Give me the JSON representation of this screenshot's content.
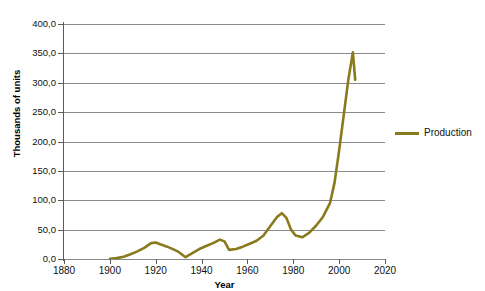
{
  "chart_data": {
    "type": "line",
    "title": "",
    "xlabel": "Year",
    "ylabel": "Thousands of units",
    "xlim": [
      1880,
      2020
    ],
    "ylim": [
      0,
      400
    ],
    "grid": "horizontal",
    "legend_position": "right",
    "line_color": "#8a7a1e",
    "x_ticks": [
      "1880",
      "1900",
      "1920",
      "1940",
      "1960",
      "1980",
      "2000",
      "2020"
    ],
    "y_ticks": [
      "0,0",
      "50,0",
      "100,0",
      "150,0",
      "200,0",
      "250,0",
      "300,0",
      "350,0",
      "400,0"
    ],
    "series": [
      {
        "name": "Production",
        "color": "#8a7a1e",
        "x": [
          1900,
          1903,
          1906,
          1909,
          1912,
          1915,
          1918,
          1920,
          1922,
          1925,
          1928,
          1930,
          1933,
          1936,
          1939,
          1942,
          1945,
          1948,
          1950,
          1952,
          1955,
          1958,
          1961,
          1964,
          1967,
          1970,
          1973,
          1975,
          1977,
          1979,
          1981,
          1984,
          1987,
          1990,
          1993,
          1996,
          1998,
          2000,
          2002,
          2004,
          2006,
          2007
        ],
        "values": [
          0.5,
          1.5,
          4.0,
          8.0,
          13.0,
          19.0,
          27.0,
          28.0,
          25.0,
          21.0,
          16.0,
          12.0,
          3.0,
          10.0,
          17.0,
          22.0,
          27.0,
          33.0,
          30.0,
          15.5,
          17.0,
          21.0,
          26.0,
          31.0,
          40.0,
          56.0,
          72.0,
          78.0,
          70.0,
          50.0,
          40.0,
          37.0,
          45.0,
          57.0,
          72.0,
          95.0,
          130.0,
          185.0,
          245.0,
          305.0,
          352.0,
          305.0
        ]
      }
    ]
  },
  "axes": {
    "y_title": "Thousands of units",
    "x_title": "Year"
  },
  "legend": {
    "entries": [
      {
        "label": "Production",
        "color": "#8a7a1e"
      }
    ]
  }
}
